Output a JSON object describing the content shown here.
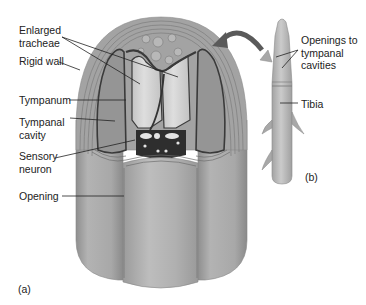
{
  "figure": {
    "panel_a": {
      "tag": "(a)",
      "labels": [
        {
          "id": "enlarged-tracheae",
          "text": "Enlarged\ntracheae"
        },
        {
          "id": "rigid-wall",
          "text": "Rigid wall"
        },
        {
          "id": "tympanum",
          "text": "Tympanum"
        },
        {
          "id": "tympanal-cavity",
          "text": "Tympanal\ncavity"
        },
        {
          "id": "sensory-neuron",
          "text": "Sensory\nneuron"
        },
        {
          "id": "opening",
          "text": "Opening"
        }
      ]
    },
    "panel_b": {
      "tag": "(b)",
      "labels": [
        {
          "id": "openings-to-tympanal-cavities",
          "text": "Openings to\ntympanal\ncavities"
        },
        {
          "id": "tibia",
          "text": "Tibia"
        }
      ]
    },
    "colors": {
      "body_fill": "#a9a9a9",
      "wall_fill": "#9e9e9e",
      "trachea_fill": "#cfcfcf",
      "cavity_fill": "#9a9a9a",
      "neuron_fill": "#2e2e2e",
      "line": "#3a3a3a",
      "text": "#222222"
    }
  }
}
